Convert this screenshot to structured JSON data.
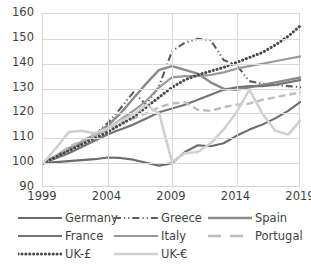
{
  "chart_data": {
    "type": "line",
    "title": "",
    "xlabel": "",
    "ylabel": "",
    "xlim": [
      1999,
      2019
    ],
    "ylim": [
      90,
      160
    ],
    "ytick_labels": [
      "160",
      "150",
      "140",
      "130",
      "120",
      "110",
      "100",
      "90"
    ],
    "yticks": [
      160,
      150,
      140,
      130,
      120,
      110,
      100,
      90
    ],
    "xtick_labels": [
      "1999",
      "2004",
      "2009",
      "2014",
      "2019"
    ],
    "xticks": [
      1999,
      2004,
      2009,
      2014,
      2019
    ],
    "grid": true,
    "legend_position": "bottom",
    "x": [
      1999,
      2000,
      2001,
      2002,
      2003,
      2004,
      2005,
      2006,
      2007,
      2008,
      2009,
      2010,
      2011,
      2012,
      2013,
      2014,
      2015,
      2016,
      2017,
      2018,
      2019
    ],
    "series": [
      {
        "name": "Germany",
        "style": "solid",
        "color": "#6b6b6b",
        "width": 2.1,
        "values": [
          100,
          100.4,
          100.8,
          101.2,
          101.6,
          102.3,
          102.1,
          101.4,
          100.2,
          99.0,
          100.0,
          104.5,
          107.2,
          106.8,
          108.0,
          111.0,
          113.5,
          115.5,
          118.0,
          121.0,
          124.8
        ]
      },
      {
        "name": "Greece",
        "style": "dash-dot-dot",
        "color": "#5c5c5c",
        "width": 2.1,
        "values": [
          100,
          102.5,
          105.5,
          108.0,
          111.5,
          116.0,
          122.0,
          128.5,
          123.5,
          131.0,
          145.0,
          148.5,
          150.0,
          149.5,
          141.5,
          139.5,
          133.0,
          132.0,
          131.5,
          131.0,
          130.5
        ]
      },
      {
        "name": "Spain",
        "style": "solid",
        "color": "#8a8a8a",
        "width": 2.4,
        "values": [
          100,
          103.0,
          106.0,
          108.5,
          111.5,
          115.0,
          120.0,
          126.0,
          132.0,
          137.5,
          139.0,
          137.5,
          136.0,
          132.5,
          130.0,
          129.5,
          130.5,
          131.5,
          132.5,
          133.5,
          134.5
        ]
      },
      {
        "name": "France",
        "style": "solid",
        "color": "#757575",
        "width": 2.2,
        "values": [
          100,
          102.0,
          104.0,
          106.5,
          109.0,
          111.5,
          113.5,
          115.5,
          118.0,
          120.5,
          122.0,
          123.5,
          125.5,
          127.5,
          129.5,
          130.5,
          131.0,
          131.0,
          131.5,
          132.5,
          133.5
        ]
      },
      {
        "name": "Italy",
        "style": "solid",
        "color": "#999999",
        "width": 2.2,
        "values": [
          100,
          102.5,
          105.5,
          108.5,
          111.0,
          114.0,
          117.5,
          121.0,
          125.0,
          130.5,
          134.5,
          135.0,
          135.0,
          135.5,
          136.5,
          138.0,
          139.0,
          140.0,
          141.0,
          142.0,
          143.0
        ]
      },
      {
        "name": "Portugal",
        "style": "dashed",
        "color": "#bdbdbd",
        "width": 2.4,
        "values": [
          100,
          103.0,
          106.5,
          109.0,
          111.5,
          113.5,
          116.0,
          118.0,
          120.0,
          122.5,
          124.0,
          124.5,
          121.5,
          121.0,
          122.5,
          123.5,
          124.0,
          125.5,
          126.5,
          127.5,
          128.5
        ]
      },
      {
        "name": "UK-£",
        "style": "dotted",
        "color": "#4a4a4a",
        "width": 3.0,
        "values": [
          100,
          102.5,
          105.0,
          107.5,
          110.0,
          112.5,
          115.5,
          118.5,
          122.5,
          126.5,
          130.5,
          133.5,
          135.5,
          137.0,
          138.5,
          140.5,
          142.5,
          144.5,
          147.5,
          151.0,
          155.5
        ]
      },
      {
        "name": "UK-€",
        "style": "solid",
        "color": "#cfcfcf",
        "width": 2.6,
        "values": [
          100,
          106.0,
          112.5,
          113.0,
          112.0,
          114.0,
          117.0,
          119.5,
          123.5,
          120.0,
          100.5,
          104.0,
          104.5,
          108.0,
          113.5,
          120.5,
          129.5,
          120.0,
          113.0,
          111.5,
          117.5
        ]
      }
    ]
  },
  "legend": {
    "items": [
      {
        "label": "Germany"
      },
      {
        "label": "Greece"
      },
      {
        "label": "Spain"
      },
      {
        "label": "France"
      },
      {
        "label": "Italy"
      },
      {
        "label": "Portugal"
      },
      {
        "label": "UK-£"
      },
      {
        "label": "UK-€"
      }
    ]
  }
}
